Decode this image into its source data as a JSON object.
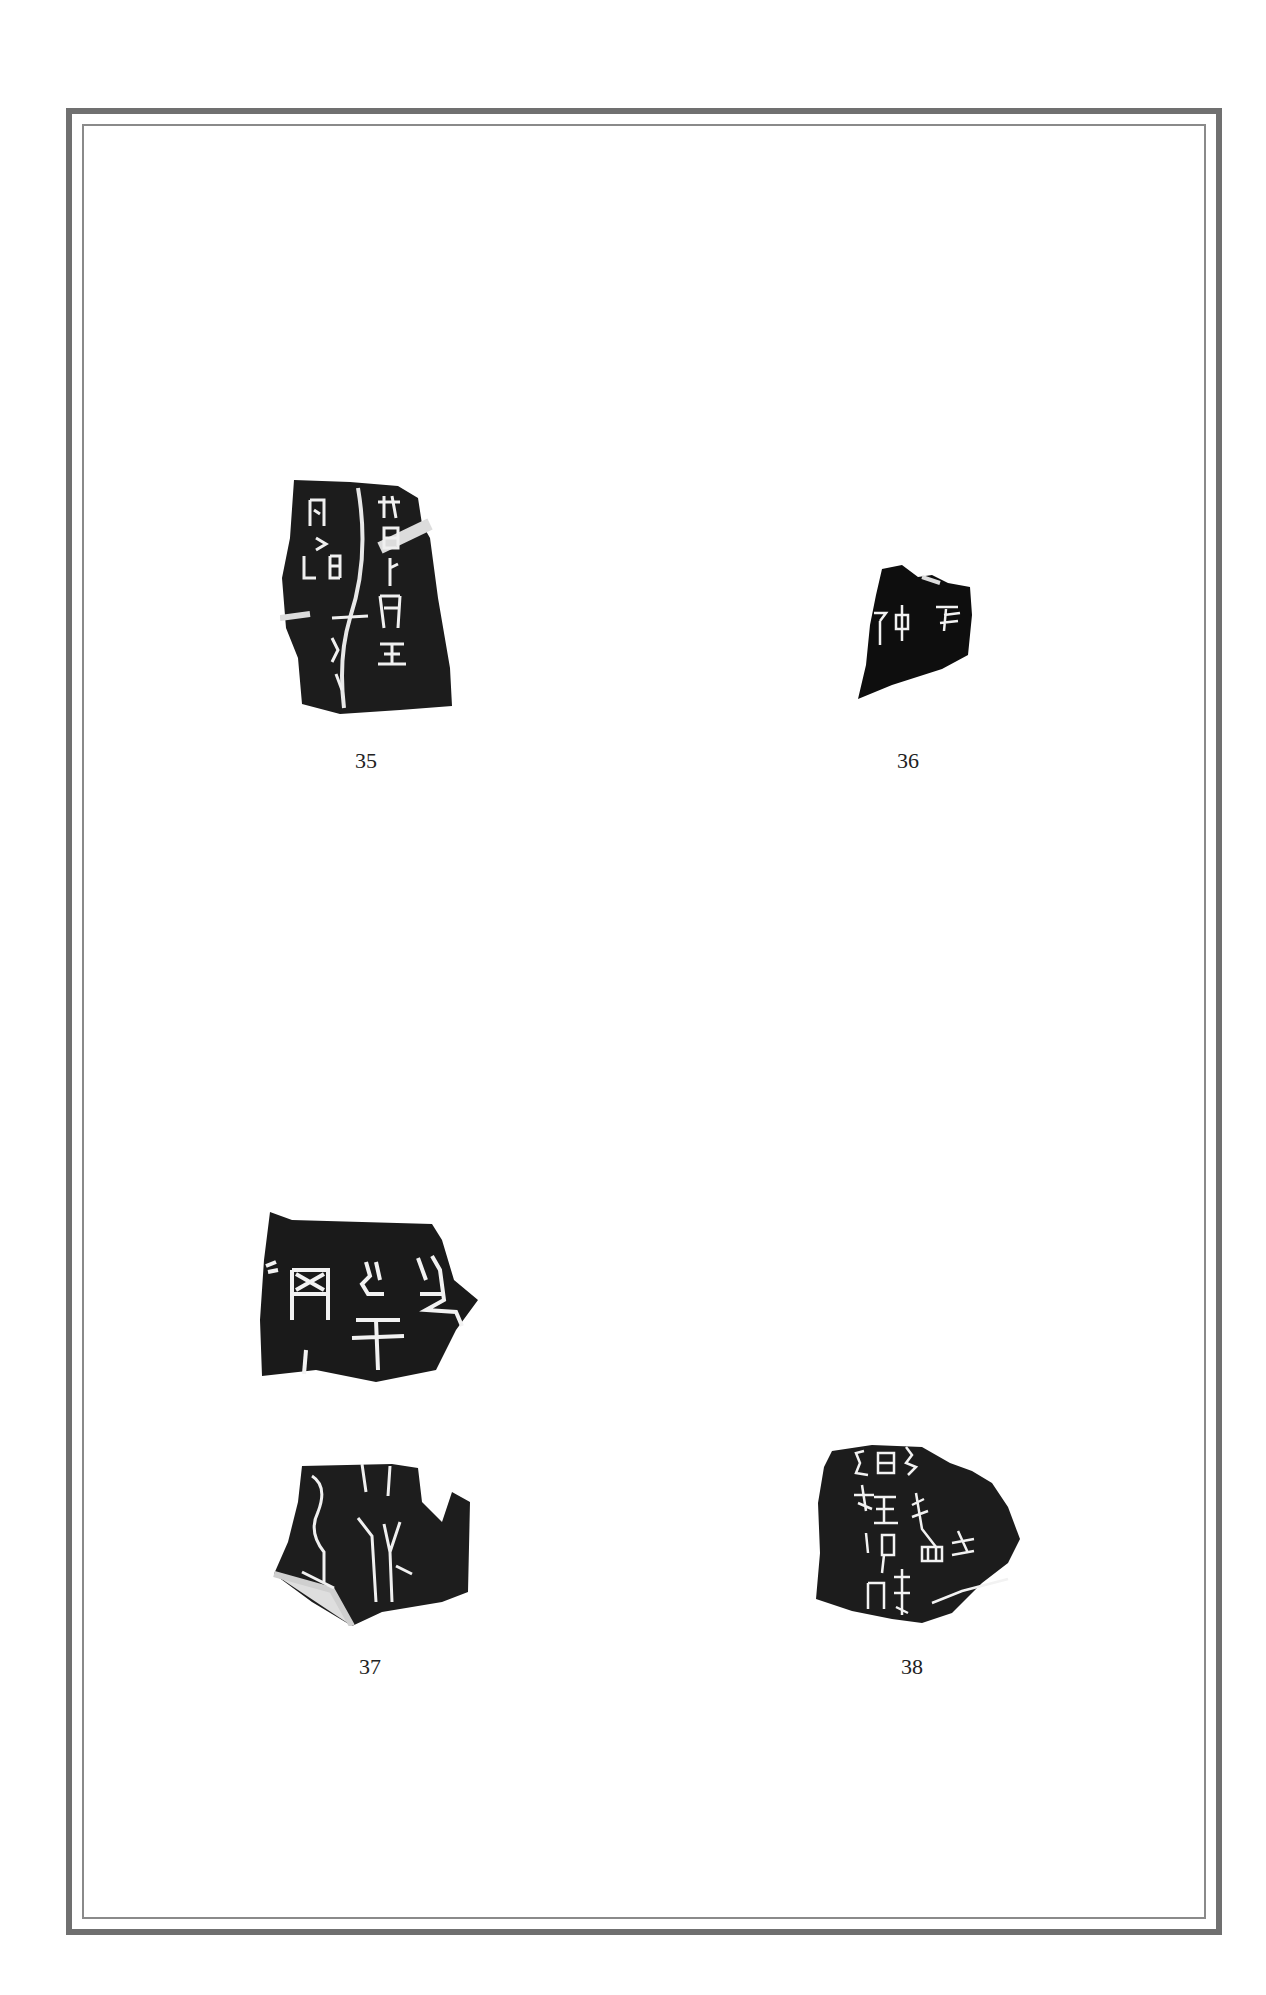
{
  "page": {
    "plates": [
      {
        "number": "35"
      },
      {
        "number": "36"
      },
      {
        "number": "37"
      },
      {
        "number": "38"
      }
    ]
  }
}
